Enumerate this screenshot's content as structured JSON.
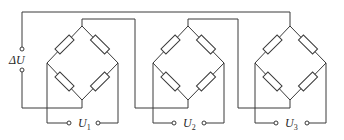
{
  "diagram": {
    "type": "circuit",
    "labels": {
      "delta_u": "ΔU",
      "u1": {
        "base": "U",
        "sub": "1"
      },
      "u2": {
        "base": "U",
        "sub": "2"
      },
      "u3": {
        "base": "U",
        "sub": "3"
      }
    },
    "bridges": [
      {
        "id": "bridge-1",
        "resistors": 4,
        "output_label": "U1"
      },
      {
        "id": "bridge-2",
        "resistors": 4,
        "output_label": "U2"
      },
      {
        "id": "bridge-3",
        "resistors": 4,
        "output_label": "U3"
      }
    ],
    "colors": {
      "line": "#3a3a3a",
      "background": "#ffffff"
    }
  }
}
